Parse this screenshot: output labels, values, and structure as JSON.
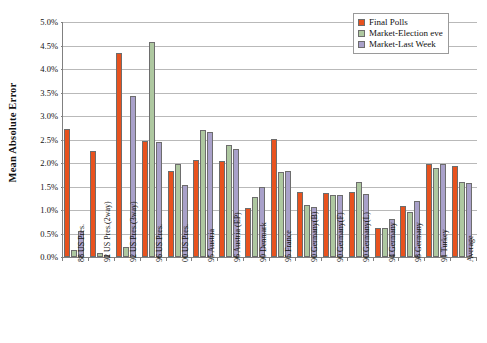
{
  "chart_data": {
    "type": "bar",
    "title": "",
    "xlabel": "",
    "ylabel": "Mean Absolute Error",
    "ylim": [
      0,
      5
    ],
    "yunit": "%",
    "grid": true,
    "legend_position": "top-right",
    "ytick_labels": [
      "0.0%",
      "0.5%",
      "1.0%",
      "1.5%",
      "2.0%",
      "2.5%",
      "3.0%",
      "3.5%",
      "4.0%",
      "4.5%",
      "5.0%"
    ],
    "ytick_values": [
      0,
      0.5,
      1.0,
      1.5,
      2.0,
      2.5,
      3.0,
      3.5,
      4.0,
      4.5,
      5.0
    ],
    "categories": [
      "88 US Pres.",
      "92 US Pres.(2way)",
      "92 US Pres.(3way)",
      "96 US Pres.",
      "00 US Pres.",
      "95 Austria",
      "96 Austria (EP)",
      "90 Denmark",
      "95 France",
      "90 Germany(B)",
      "90 Germany(F)",
      "90 Germany(L)",
      "94 Germany",
      "98 Germany",
      "91 Turkey",
      "Average"
    ],
    "series": [
      {
        "name": "Final Polls",
        "color": "#E8521E",
        "values": [
          2.72,
          2.26,
          4.35,
          2.46,
          1.82,
          2.07,
          2.05,
          1.05,
          2.52,
          1.38,
          1.36,
          1.38,
          0.61,
          1.08,
          1.97,
          1.93
        ]
      },
      {
        "name": "Market-Election eve",
        "color": "#AEC8A0",
        "values": [
          0.15,
          0.08,
          0.22,
          4.58,
          1.97,
          2.7,
          2.38,
          1.28,
          1.8,
          1.1,
          1.32,
          1.6,
          0.62,
          0.95,
          1.9,
          1.6
        ]
      },
      {
        "name": "Market-Last Week",
        "color": "#A9A1CA",
        "values": [
          0.55,
          0.05,
          3.43,
          2.44,
          1.54,
          2.66,
          2.3,
          1.5,
          1.82,
          1.07,
          1.33,
          1.35,
          0.8,
          1.19,
          1.97,
          1.57
        ]
      }
    ]
  },
  "legend": {
    "items": [
      {
        "label": "Final Polls",
        "color": "#E8521E"
      },
      {
        "label": "Market-Election eve",
        "color": "#AEC8A0"
      },
      {
        "label": "Market-Last Week",
        "color": "#A9A1CA"
      }
    ]
  }
}
